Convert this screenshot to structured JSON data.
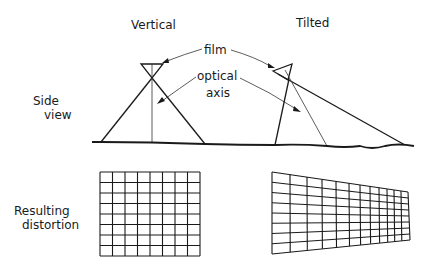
{
  "columns": {
    "vertical_title": "Vertical",
    "tilted_title": "Tilted"
  },
  "rows": {
    "side_view_line1": "Side",
    "side_view_line2": "view",
    "distortion_line1": "Resulting",
    "distortion_line2": "distortion"
  },
  "callouts": {
    "film": "film",
    "optical_line1": "optical",
    "optical_line2": "axis"
  },
  "grids": {
    "vertical": {
      "columns": 8,
      "rows": 8
    },
    "tilted": {
      "columns": 13,
      "rows": 8
    }
  },
  "colors": {
    "line": "#1a1a1a",
    "background": "#ffffff"
  }
}
